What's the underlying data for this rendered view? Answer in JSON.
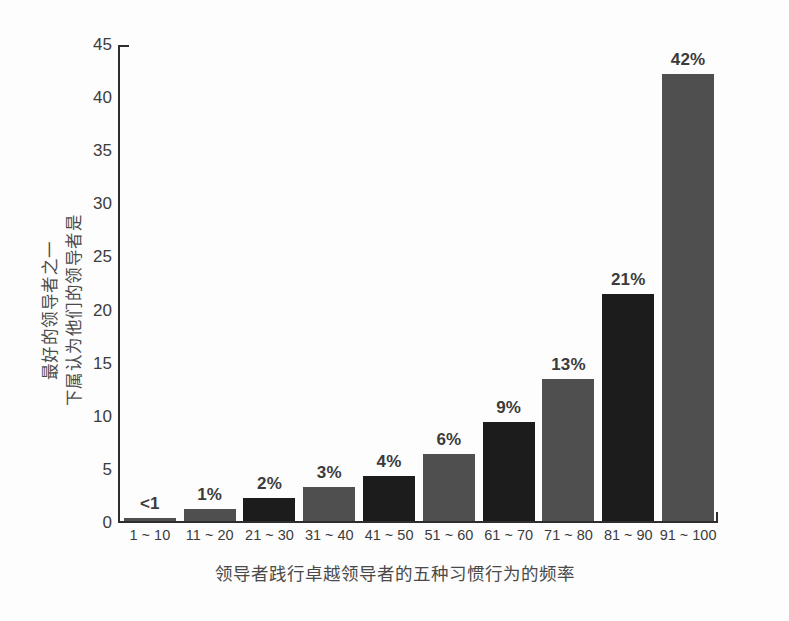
{
  "chart_data": {
    "type": "bar",
    "title": "",
    "xlabel": "领导者践行卓越领导者的五种习惯行为的频率",
    "ylabel_lines": [
      "下属认为他们的领导者是",
      "最好的领导者之一"
    ],
    "categories": [
      "1 ~ 10",
      "11 ~ 20",
      "21 ~ 30",
      "31 ~ 40",
      "41 ~ 50",
      "51 ~ 60",
      "61 ~ 70",
      "71 ~ 80",
      "81 ~ 90",
      "91 ~ 100"
    ],
    "values": [
      0.3,
      1.1,
      2.2,
      3.2,
      4.3,
      6.3,
      9.4,
      13.4,
      21.5,
      42.3
    ],
    "data_labels": [
      "<1",
      "1%",
      "2%",
      "3%",
      "4%",
      "6%",
      "9%",
      "13%",
      "21%",
      "42%"
    ],
    "ylim": [
      0,
      45
    ],
    "yticks": [
      0,
      5,
      10,
      15,
      20,
      25,
      30,
      35,
      40,
      45
    ],
    "ytick_labels": [
      "0",
      "5",
      "10",
      "15",
      "20",
      "25",
      "30",
      "35",
      "40",
      "45"
    ],
    "grid": false,
    "legend": false,
    "bar_colors": [
      "#4f4f4f",
      "#4f4f4f",
      "#1c1c1c",
      "#4f4f4f",
      "#1c1c1c",
      "#4f4f4f",
      "#1c1c1c",
      "#4f4f4f",
      "#1c1c1c",
      "#4f4f4f"
    ],
    "axis_color": "#2e2e2e",
    "label_color": "#3b3b3b"
  }
}
